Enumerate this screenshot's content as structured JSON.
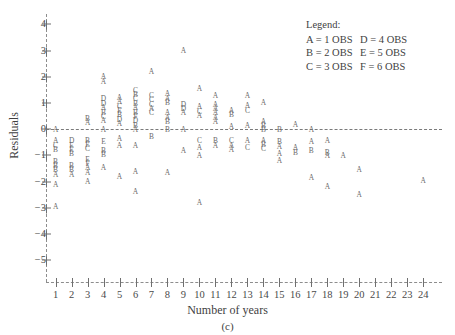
{
  "chart_data": {
    "type": "scatter",
    "title": "",
    "caption": "(c)",
    "xlabel": "Number of years",
    "ylabel": "Residuals",
    "xlim": [
      0.4,
      24.8
    ],
    "ylim": [
      -5.6,
      4.4
    ],
    "xticks": [
      1,
      2,
      3,
      4,
      5,
      6,
      7,
      8,
      9,
      10,
      11,
      12,
      13,
      14,
      15,
      16,
      17,
      18,
      19,
      20,
      21,
      22,
      23,
      24
    ],
    "yticks": [
      4,
      3,
      2,
      1,
      0,
      -1,
      -2,
      -3,
      -4,
      -5
    ],
    "ytick_labels": [
      "4",
      "3",
      "2",
      "1",
      "0",
      "−1",
      "−2",
      "−3",
      "−4",
      "−5"
    ],
    "grid": false,
    "zero_reference_line": 0,
    "legend": {
      "position": "top-right",
      "title": "Legend:",
      "entries": [
        {
          "symbol": "A",
          "text": "A = 1 OBS",
          "count": 1
        },
        {
          "symbol": "B",
          "text": "B = 2 OBS",
          "count": 2
        },
        {
          "symbol": "C",
          "text": "C = 3 OBS",
          "count": 3
        },
        {
          "symbol": "D",
          "text": "D = 4 OBS",
          "count": 4
        },
        {
          "symbol": "E",
          "text": "E = 5 OBS",
          "count": 5
        },
        {
          "symbol": "F",
          "text": "F = 6 OBS",
          "count": 6
        }
      ],
      "rows": [
        {
          "left": "A = 1 OBS",
          "right": "D = 4 OBS"
        },
        {
          "left": "B = 2 OBS",
          "right": "E = 5 OBS"
        },
        {
          "left": "C = 3 OBS",
          "right": "F = 6 OBS"
        }
      ]
    },
    "points": [
      {
        "x": 1,
        "y": 0.0,
        "label": "A"
      },
      {
        "x": 1,
        "y": -0.45,
        "label": "A"
      },
      {
        "x": 1,
        "y": -0.62,
        "label": "C"
      },
      {
        "x": 1,
        "y": -0.78,
        "label": "B"
      },
      {
        "x": 1,
        "y": -1.22,
        "label": "B"
      },
      {
        "x": 1,
        "y": -1.38,
        "label": "B"
      },
      {
        "x": 1,
        "y": -1.55,
        "label": "B"
      },
      {
        "x": 1,
        "y": -1.72,
        "label": "A"
      },
      {
        "x": 1,
        "y": -2.1,
        "label": "A"
      },
      {
        "x": 1,
        "y": -2.95,
        "label": "A"
      },
      {
        "x": 2,
        "y": -0.45,
        "label": "D"
      },
      {
        "x": 2,
        "y": -0.62,
        "label": "E"
      },
      {
        "x": 2,
        "y": -0.78,
        "label": "E"
      },
      {
        "x": 2,
        "y": -0.95,
        "label": "B"
      },
      {
        "x": 2,
        "y": -1.38,
        "label": "B"
      },
      {
        "x": 2,
        "y": -1.55,
        "label": "B"
      },
      {
        "x": 2,
        "y": -1.72,
        "label": "A"
      },
      {
        "x": 3,
        "y": 0.42,
        "label": "B"
      },
      {
        "x": 3,
        "y": 0.25,
        "label": "A"
      },
      {
        "x": 3,
        "y": -0.42,
        "label": "B"
      },
      {
        "x": 3,
        "y": -0.58,
        "label": "E"
      },
      {
        "x": 3,
        "y": -0.75,
        "label": "C"
      },
      {
        "x": 3,
        "y": -1.15,
        "label": "E"
      },
      {
        "x": 3,
        "y": -1.32,
        "label": "F"
      },
      {
        "x": 3,
        "y": -1.48,
        "label": "A"
      },
      {
        "x": 3,
        "y": -1.65,
        "label": "A"
      },
      {
        "x": 3,
        "y": -2.0,
        "label": "A"
      },
      {
        "x": 4,
        "y": 2.0,
        "label": "A"
      },
      {
        "x": 4,
        "y": 1.82,
        "label": "A"
      },
      {
        "x": 4,
        "y": 1.15,
        "label": "D"
      },
      {
        "x": 4,
        "y": 0.98,
        "label": "D"
      },
      {
        "x": 4,
        "y": 0.82,
        "label": "A"
      },
      {
        "x": 4,
        "y": 0.65,
        "label": "B"
      },
      {
        "x": 4,
        "y": 0.48,
        "label": "C"
      },
      {
        "x": 4,
        "y": 0.32,
        "label": "A"
      },
      {
        "x": 4,
        "y": 0.0,
        "label": "A"
      },
      {
        "x": 4,
        "y": -0.48,
        "label": "E"
      },
      {
        "x": 4,
        "y": -0.82,
        "label": "B"
      },
      {
        "x": 4,
        "y": -0.98,
        "label": "B"
      },
      {
        "x": 4,
        "y": -1.45,
        "label": "A"
      },
      {
        "x": 5,
        "y": 1.22,
        "label": "A"
      },
      {
        "x": 5,
        "y": 1.05,
        "label": "A"
      },
      {
        "x": 5,
        "y": 0.88,
        "label": "C"
      },
      {
        "x": 5,
        "y": 0.72,
        "label": "E"
      },
      {
        "x": 5,
        "y": 0.55,
        "label": "B"
      },
      {
        "x": 5,
        "y": 0.38,
        "label": "D"
      },
      {
        "x": 5,
        "y": 0.22,
        "label": "A"
      },
      {
        "x": 5,
        "y": -0.35,
        "label": "A"
      },
      {
        "x": 5,
        "y": -0.62,
        "label": "A"
      },
      {
        "x": 5,
        "y": -1.8,
        "label": "A"
      },
      {
        "x": 6,
        "y": 1.48,
        "label": "C"
      },
      {
        "x": 6,
        "y": 1.32,
        "label": "B"
      },
      {
        "x": 6,
        "y": 1.15,
        "label": "C"
      },
      {
        "x": 6,
        "y": 0.98,
        "label": "B"
      },
      {
        "x": 6,
        "y": 0.82,
        "label": "A"
      },
      {
        "x": 6,
        "y": 0.65,
        "label": "B"
      },
      {
        "x": 6,
        "y": 0.48,
        "label": "F"
      },
      {
        "x": 6,
        "y": 0.32,
        "label": "D"
      },
      {
        "x": 6,
        "y": 0.15,
        "label": "B"
      },
      {
        "x": 6,
        "y": 0.0,
        "label": "A"
      },
      {
        "x": 6,
        "y": -0.62,
        "label": "A"
      },
      {
        "x": 6,
        "y": -1.62,
        "label": "A"
      },
      {
        "x": 6,
        "y": -2.4,
        "label": "A"
      },
      {
        "x": 7,
        "y": 2.2,
        "label": "A"
      },
      {
        "x": 7,
        "y": 1.28,
        "label": "C"
      },
      {
        "x": 7,
        "y": 1.12,
        "label": "C"
      },
      {
        "x": 7,
        "y": 0.95,
        "label": "C"
      },
      {
        "x": 7,
        "y": 0.78,
        "label": "A"
      },
      {
        "x": 7,
        "y": 0.62,
        "label": "C"
      },
      {
        "x": 7,
        "y": -0.3,
        "label": "B"
      },
      {
        "x": 8,
        "y": 1.35,
        "label": "A"
      },
      {
        "x": 8,
        "y": 1.18,
        "label": "A"
      },
      {
        "x": 8,
        "y": 1.02,
        "label": "B"
      },
      {
        "x": 8,
        "y": 0.62,
        "label": "A"
      },
      {
        "x": 8,
        "y": 0.45,
        "label": "A"
      },
      {
        "x": 8,
        "y": 0.28,
        "label": "B"
      },
      {
        "x": 8,
        "y": 0.0,
        "label": "B"
      },
      {
        "x": 8,
        "y": -1.65,
        "label": "A"
      },
      {
        "x": 9,
        "y": 3.0,
        "label": "A"
      },
      {
        "x": 9,
        "y": 0.95,
        "label": "D"
      },
      {
        "x": 9,
        "y": 0.78,
        "label": "D"
      },
      {
        "x": 9,
        "y": 0.62,
        "label": "A"
      },
      {
        "x": 9,
        "y": 0.0,
        "label": "A"
      },
      {
        "x": 9,
        "y": -0.8,
        "label": "A"
      },
      {
        "x": 10,
        "y": 1.55,
        "label": "A"
      },
      {
        "x": 10,
        "y": 0.85,
        "label": "A"
      },
      {
        "x": 10,
        "y": 0.68,
        "label": "C"
      },
      {
        "x": 10,
        "y": 0.52,
        "label": "A"
      },
      {
        "x": 10,
        "y": -0.45,
        "label": "C"
      },
      {
        "x": 10,
        "y": -0.72,
        "label": "A"
      },
      {
        "x": 10,
        "y": -1.0,
        "label": "A"
      },
      {
        "x": 10,
        "y": -2.8,
        "label": "A"
      },
      {
        "x": 11,
        "y": 1.3,
        "label": "A"
      },
      {
        "x": 11,
        "y": 0.95,
        "label": "A"
      },
      {
        "x": 11,
        "y": 0.78,
        "label": "A"
      },
      {
        "x": 11,
        "y": 0.62,
        "label": "A"
      },
      {
        "x": 11,
        "y": 0.45,
        "label": "A"
      },
      {
        "x": 11,
        "y": 0.28,
        "label": "A"
      },
      {
        "x": 11,
        "y": -0.45,
        "label": "B"
      },
      {
        "x": 11,
        "y": -0.62,
        "label": "A"
      },
      {
        "x": 12,
        "y": 0.72,
        "label": "A"
      },
      {
        "x": 12,
        "y": 0.55,
        "label": "B"
      },
      {
        "x": 12,
        "y": 0.1,
        "label": "A"
      },
      {
        "x": 12,
        "y": -0.45,
        "label": "C"
      },
      {
        "x": 12,
        "y": -0.62,
        "label": "A"
      },
      {
        "x": 12,
        "y": -0.78,
        "label": "A"
      },
      {
        "x": 13,
        "y": 1.3,
        "label": "A"
      },
      {
        "x": 13,
        "y": 0.9,
        "label": "A"
      },
      {
        "x": 13,
        "y": 0.72,
        "label": "C"
      },
      {
        "x": 13,
        "y": 0.12,
        "label": "A"
      },
      {
        "x": 13,
        "y": -0.45,
        "label": "A"
      },
      {
        "x": 13,
        "y": -0.72,
        "label": "C"
      },
      {
        "x": 14,
        "y": 1.0,
        "label": "A"
      },
      {
        "x": 14,
        "y": 0.3,
        "label": "A"
      },
      {
        "x": 14,
        "y": 0.15,
        "label": "B"
      },
      {
        "x": 14,
        "y": 0.0,
        "label": "B"
      },
      {
        "x": 14,
        "y": -0.42,
        "label": "A"
      },
      {
        "x": 14,
        "y": -0.58,
        "label": "B"
      },
      {
        "x": 14,
        "y": -0.75,
        "label": "C"
      },
      {
        "x": 15,
        "y": 0.0,
        "label": "B"
      },
      {
        "x": 15,
        "y": -0.48,
        "label": "B"
      },
      {
        "x": 15,
        "y": -0.65,
        "label": "A"
      },
      {
        "x": 15,
        "y": -0.95,
        "label": "A"
      },
      {
        "x": 15,
        "y": -1.2,
        "label": "A"
      },
      {
        "x": 16,
        "y": 0.18,
        "label": "A"
      },
      {
        "x": 16,
        "y": -0.72,
        "label": "A"
      },
      {
        "x": 16,
        "y": -0.88,
        "label": "B"
      },
      {
        "x": 17,
        "y": 0.0,
        "label": "A"
      },
      {
        "x": 17,
        "y": -0.48,
        "label": "A"
      },
      {
        "x": 17,
        "y": -0.82,
        "label": "B"
      },
      {
        "x": 17,
        "y": -1.85,
        "label": "A"
      },
      {
        "x": 18,
        "y": -0.42,
        "label": "A"
      },
      {
        "x": 18,
        "y": -0.88,
        "label": "B"
      },
      {
        "x": 18,
        "y": -1.0,
        "label": "A"
      },
      {
        "x": 18,
        "y": -2.2,
        "label": "A"
      },
      {
        "x": 19,
        "y": -1.0,
        "label": "A"
      },
      {
        "x": 20,
        "y": -1.55,
        "label": "A"
      },
      {
        "x": 20,
        "y": -2.5,
        "label": "A"
      },
      {
        "x": 24,
        "y": -1.95,
        "label": "A"
      }
    ]
  }
}
